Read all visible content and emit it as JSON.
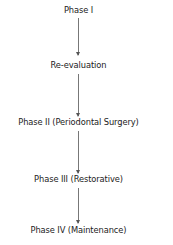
{
  "diagram": {
    "type": "flowchart",
    "direction": "top-to-bottom",
    "nodes": [
      {
        "id": "phase1",
        "label": "Phase I"
      },
      {
        "id": "reeval",
        "label": "Re-evaluation"
      },
      {
        "id": "phase2",
        "label": "Phase II (Periodontal Surgery)"
      },
      {
        "id": "phase3",
        "label": "Phase III (Restorative)"
      },
      {
        "id": "phase4",
        "label": "Phase IV (Maintenance)"
      }
    ],
    "edges": [
      {
        "from": "phase1",
        "to": "reeval"
      },
      {
        "from": "reeval",
        "to": "phase2"
      },
      {
        "from": "phase2",
        "to": "phase3"
      },
      {
        "from": "phase3",
        "to": "phase4"
      }
    ],
    "arrow_color": "#777777",
    "text_color": "#222222"
  }
}
